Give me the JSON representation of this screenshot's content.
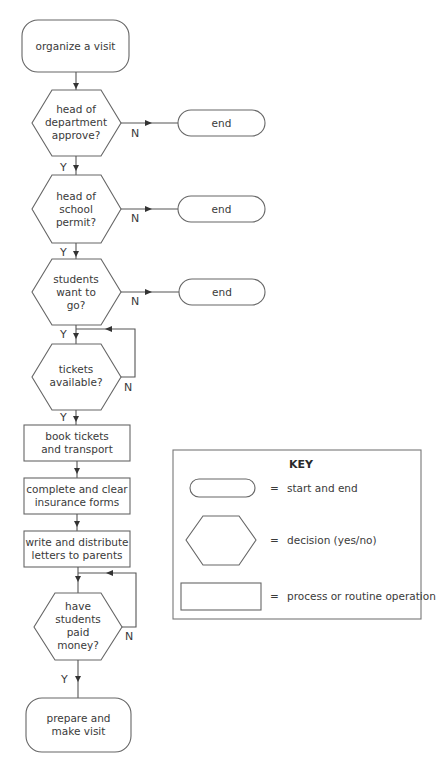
{
  "flowchart": {
    "start": {
      "lines": [
        "organize a visit"
      ]
    },
    "decisions": [
      {
        "lines": [
          "head of",
          "department",
          "approve?"
        ],
        "no_label": "N",
        "yes_label": "Y",
        "no_target": "end"
      },
      {
        "lines": [
          "head of",
          "school",
          "permit?"
        ],
        "no_label": "N",
        "yes_label": "Y",
        "no_target": "end"
      },
      {
        "lines": [
          "students",
          "want to",
          "go?"
        ],
        "no_label": "N",
        "yes_label": "Y",
        "no_target": "end"
      },
      {
        "lines": [
          "tickets",
          "available?"
        ],
        "no_label": "N",
        "yes_label": "Y",
        "no_target": "loop"
      }
    ],
    "end_label": "end",
    "processes": [
      {
        "lines": [
          "book tickets",
          "and transport"
        ]
      },
      {
        "lines": [
          "complete and clear",
          "insurance forms"
        ]
      },
      {
        "lines": [
          "write and distribute",
          "letters to parents"
        ]
      }
    ],
    "final_decision": {
      "lines": [
        "have",
        "students",
        "paid",
        "money?"
      ],
      "no_label": "N",
      "yes_label": "Y"
    },
    "finish": {
      "lines": [
        "prepare and",
        "make visit"
      ]
    }
  },
  "key": {
    "title": "KEY",
    "items": [
      {
        "shape": "rounded-rectangle",
        "equals": "=",
        "meaning": "start and end"
      },
      {
        "shape": "hexagon",
        "equals": "=",
        "meaning": "decision (yes/no)"
      },
      {
        "shape": "rectangle",
        "equals": "=",
        "meaning": "process or routine operation"
      }
    ]
  }
}
